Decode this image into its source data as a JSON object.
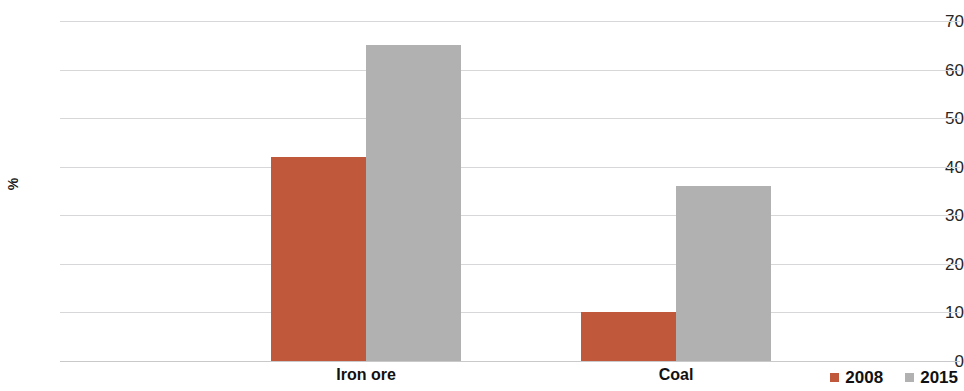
{
  "chart_data": {
    "type": "bar",
    "title": "",
    "subtitle": "",
    "xlabel": "",
    "ylabel": "%",
    "categories": [
      "Iron ore",
      "Coal"
    ],
    "series": [
      {
        "name": "2008",
        "color": "#c0583c",
        "values": [
          42,
          10
        ]
      },
      {
        "name": "2015",
        "color": "#b1b1b1",
        "values": [
          65,
          36
        ]
      }
    ],
    "ylim": [
      0,
      70
    ],
    "yticks": [
      0,
      10,
      20,
      30,
      40,
      50,
      60,
      70
    ],
    "ytick_labels": [
      "0",
      "10",
      "20",
      "30",
      "40",
      "50",
      "60",
      "70"
    ],
    "grid": true,
    "grid_axis": "y",
    "legend_position": "bottom-right",
    "background": "#ffffff",
    "gridline_color": "#d7d7d9"
  },
  "legend": {
    "entries": [
      {
        "label": "2008",
        "color": "#c0583c"
      },
      {
        "label": "2015",
        "color": "#b1b1b1"
      }
    ]
  },
  "axis": {
    "y_title": "%"
  }
}
